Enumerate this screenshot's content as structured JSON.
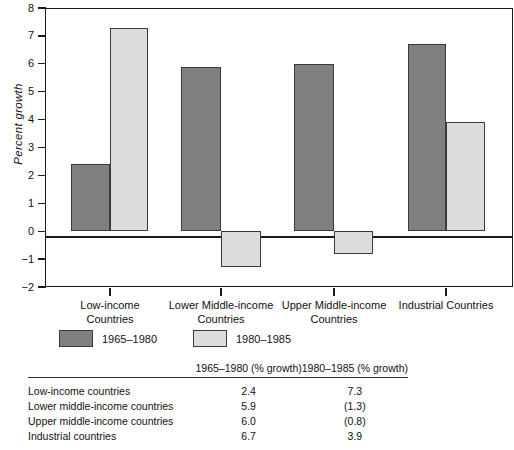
{
  "chart_data": {
    "type": "bar",
    "title": "",
    "xlabel": "",
    "ylabel": "Percent growth",
    "ylim": [
      -2,
      8
    ],
    "ytick_labels": [
      "8",
      "7",
      "6",
      "5",
      "4",
      "3",
      "2",
      "1",
      "0",
      "-1",
      "-2"
    ],
    "ytick_values": [
      8,
      7,
      6,
      5,
      4,
      3,
      2,
      1,
      0,
      -1,
      -2
    ],
    "grid": false,
    "legend_position": "below-axes-left",
    "categories": [
      "Low-income Countries",
      "Lower Middle-income Countries",
      "Upper Middle-income Countries",
      "Industrial Countries"
    ],
    "series": [
      {
        "name": "1965–1980",
        "color": "#808080",
        "values": [
          2.4,
          5.9,
          6.0,
          6.7
        ]
      },
      {
        "name": "1980–1985",
        "color": "#dcdcdc",
        "values": [
          7.3,
          -1.3,
          -0.8,
          3.9
        ]
      }
    ]
  },
  "chart": {
    "y_axis_title": "Percent growth",
    "y_ticks": [
      {
        "label": "8"
      },
      {
        "label": "7"
      },
      {
        "label": "6"
      },
      {
        "label": "5"
      },
      {
        "label": "4"
      },
      {
        "label": "3"
      },
      {
        "label": "2"
      },
      {
        "label": "1"
      },
      {
        "label": "0"
      },
      {
        "label": "-1"
      },
      {
        "label": "-2"
      }
    ],
    "x_categories": [
      {
        "line1": "Low-income",
        "line2": "Countries"
      },
      {
        "line1": "Lower Middle-income",
        "line2": "Countries"
      },
      {
        "line1": "Upper Middle-income",
        "line2": "Countries"
      },
      {
        "line1": "Industrial Countries",
        "line2": ""
      }
    ],
    "legend": [
      {
        "label": "1965–1980",
        "color": "#808080"
      },
      {
        "label": "1980–1985",
        "color": "#dcdcdc"
      }
    ]
  },
  "table": {
    "headers": {
      "label": "",
      "col1": "1965–1980 (% growth)",
      "col2": "1980–1985 (% growth)"
    },
    "rows": [
      {
        "label": "Low-income countries",
        "col1": "2.4",
        "col2": "7.3"
      },
      {
        "label": "Lower middle-income countries",
        "col1": "5.9",
        "col2": "(1.3)"
      },
      {
        "label": "Upper middle-income countries",
        "col1": "6.0",
        "col2": "(0.8)"
      },
      {
        "label": "Industrial countries",
        "col1": "6.7",
        "col2": "3.9"
      }
    ]
  }
}
